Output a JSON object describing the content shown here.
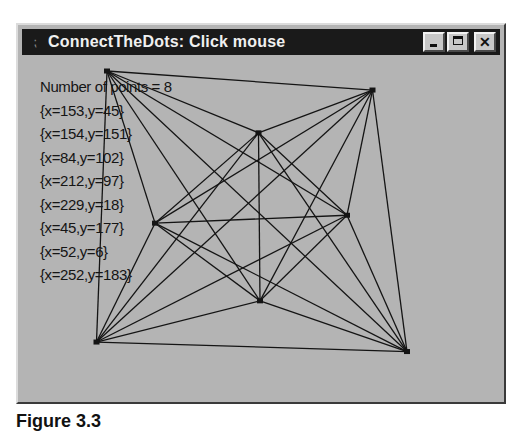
{
  "window": {
    "title": "ConnectTheDots: Click mouse",
    "system_icon": "⁏",
    "buttons": {
      "minimize": "minimize",
      "maximize": "maximize",
      "close": "✕"
    }
  },
  "content": {
    "count_label": "Number of points = 8",
    "points_text": [
      "{x=153,y=45}",
      "{x=154,y=151}",
      "{x=84,y=102}",
      "{x=212,y=97}",
      "{x=229,y=18}",
      "{x=45,y=177}",
      "{x=52,y=6}",
      "{x=252,y=183}"
    ],
    "points": [
      {
        "x": 153,
        "y": 45
      },
      {
        "x": 154,
        "y": 151
      },
      {
        "x": 84,
        "y": 102
      },
      {
        "x": 212,
        "y": 97
      },
      {
        "x": 229,
        "y": 18
      },
      {
        "x": 45,
        "y": 177
      },
      {
        "x": 52,
        "y": 6
      },
      {
        "x": 252,
        "y": 183
      }
    ],
    "line_color": "#141414",
    "background_color": "#b4b4b4"
  },
  "caption": {
    "text": "Figure 3.3"
  }
}
